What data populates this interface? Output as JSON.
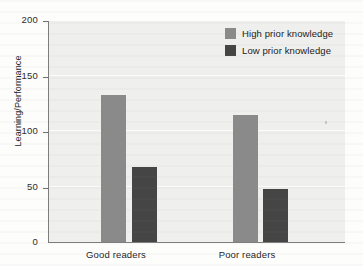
{
  "chart_data": {
    "type": "bar",
    "title": "",
    "xlabel": "",
    "ylabel": "Learning/Performance",
    "categories": [
      "Good readers",
      "Poor readers"
    ],
    "series": [
      {
        "name": "High prior knowledge",
        "values": [
          132,
          114
        ],
        "color": "#8a8a8a"
      },
      {
        "name": "Low prior knowledge",
        "values": [
          68,
          48
        ],
        "color": "#454545"
      }
    ],
    "ylim": [
      0,
      200
    ],
    "yticks": [
      0,
      50,
      100,
      150,
      200
    ],
    "ytick_labels": [
      "0",
      "50",
      "100",
      "150",
      "200"
    ],
    "grid": true,
    "legend_position": "top-right"
  },
  "axes": {
    "y": {
      "label": "Learning/Performance",
      "ticks": [
        {
          "value": 200,
          "label": "200"
        },
        {
          "value": 150,
          "label": "150"
        },
        {
          "value": 100,
          "label": "100"
        },
        {
          "value": 50,
          "label": "50"
        },
        {
          "value": 0,
          "label": "0"
        }
      ]
    },
    "x": {
      "categories": [
        {
          "label": "Good readers"
        },
        {
          "label": "Poor readers"
        }
      ]
    }
  },
  "legend": {
    "entries": [
      {
        "label": "High prior knowledge",
        "color": "#8a8a8a"
      },
      {
        "label": "Low prior knowledge",
        "color": "#454545"
      }
    ]
  },
  "bars": [
    {
      "group": "Good readers",
      "series": "High prior knowledge",
      "value": 132
    },
    {
      "group": "Good readers",
      "series": "Low prior knowledge",
      "value": 68
    },
    {
      "group": "Poor readers",
      "series": "High prior knowledge",
      "value": 114
    },
    {
      "group": "Poor readers",
      "series": "Low prior knowledge",
      "value": 48
    }
  ]
}
